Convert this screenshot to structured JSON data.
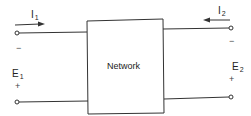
{
  "diagram": {
    "block": {
      "label": "Network"
    },
    "port1": {
      "current": {
        "symbol": "I",
        "subscript": "1",
        "direction": "right"
      },
      "voltage": {
        "symbol": "E",
        "subscript": "1"
      },
      "top_sign": "−",
      "bottom_sign": "+"
    },
    "port2": {
      "current": {
        "symbol": "I",
        "subscript": "2",
        "direction": "left"
      },
      "voltage": {
        "symbol": "E",
        "subscript": "2"
      },
      "top_sign": "−",
      "bottom_sign": "+"
    },
    "colors": {
      "line": "#333333",
      "text": "#222222",
      "background": "#ffffff"
    }
  }
}
